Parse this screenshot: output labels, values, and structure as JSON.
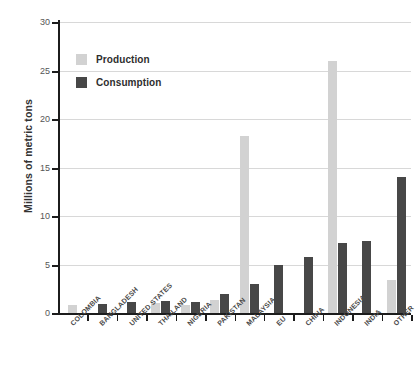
{
  "chart_data": {
    "type": "bar",
    "title": "",
    "subtitle": "",
    "xlabel": "",
    "ylabel": "Millions of metric tons",
    "ylim": [
      0,
      30
    ],
    "yticks": [
      0,
      5,
      10,
      15,
      20,
      25,
      30
    ],
    "ytick_labels": [
      "0",
      "5",
      "10",
      "15",
      "20",
      "25",
      "30"
    ],
    "grid": true,
    "legend_position": "top-left",
    "categories": [
      "COLOMBIA",
      "BANGLADESH",
      "UNITED STATES",
      "THAILAND",
      "NIGERIA",
      "PAKISTAN",
      "MALAYSIA",
      "EU",
      "CHINA",
      "INDONESIA",
      "INDIA",
      "OTHER"
    ],
    "series": [
      {
        "name": "Production",
        "color": "#d2d2d2",
        "values": [
          0.8,
          0,
          0,
          1.0,
          0.8,
          1.3,
          18.3,
          0,
          0,
          26.0,
          0,
          3.4
        ]
      },
      {
        "name": "Consumption",
        "color": "#474747",
        "values": [
          0,
          0.9,
          1.1,
          1.2,
          1.1,
          2.0,
          3.0,
          5.0,
          5.8,
          7.2,
          7.4,
          14.0
        ]
      }
    ]
  },
  "legend": {
    "items": [
      {
        "label": "Production",
        "key": "production"
      },
      {
        "label": "Consumption",
        "key": "consumption"
      }
    ]
  }
}
